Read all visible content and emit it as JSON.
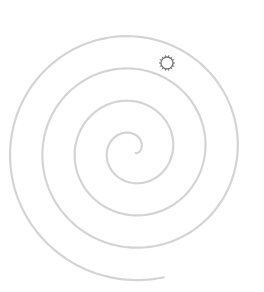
{
  "canvas": {
    "width": 264,
    "height": 292,
    "background": "#ffffff"
  },
  "spiral": {
    "stroke": "#d4d4d4",
    "stroke_width": 2.2,
    "center": [
      132,
      150
    ],
    "start_radius": 5,
    "growth_per_radian": 5.15,
    "turns": 3.9,
    "start_angle_deg": 40,
    "direction": -1
  },
  "sun_icon": {
    "cx": 167,
    "cy": 63,
    "r": 6,
    "ray_count": 14,
    "ray_length": 2,
    "stroke": "#777777",
    "fill": "#ffffff"
  }
}
